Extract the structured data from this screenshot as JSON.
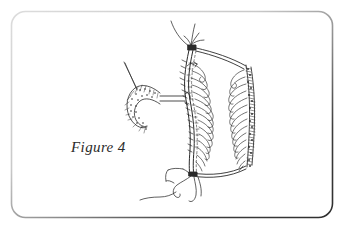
{
  "figure": {
    "caption": "Figure 4",
    "title": "Figure 4",
    "medium": "pen-and-ink line drawing",
    "background_color": "#ffffff",
    "ink_color": "#2b2b2b",
    "frame": {
      "highlight_color": "#d6d6d6",
      "shadow_color": "#333333",
      "corner_radius": "14"
    },
    "parts": [
      {
        "name": "suture-knot-top",
        "label": ""
      },
      {
        "name": "needle-thread-left",
        "label": ""
      },
      {
        "name": "resected-segment",
        "label": ""
      },
      {
        "name": "mucosal-folds",
        "label": ""
      },
      {
        "name": "stippled-cut-edge",
        "label": ""
      },
      {
        "name": "suture-tails-bottom",
        "label": ""
      }
    ]
  }
}
